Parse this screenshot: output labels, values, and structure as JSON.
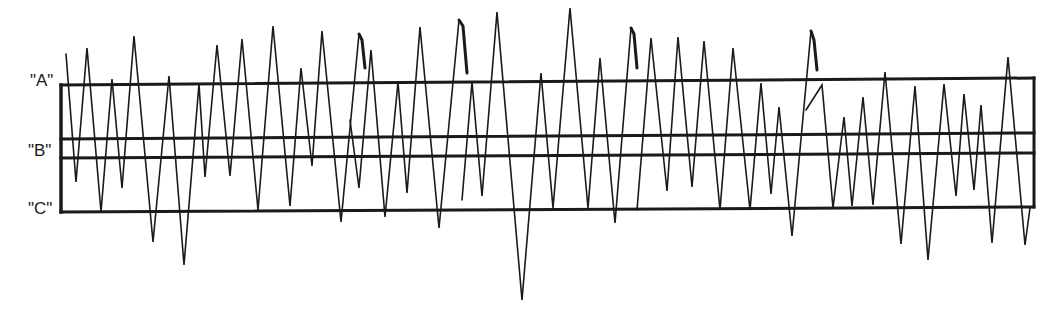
{
  "diagram": {
    "labels": {
      "a": "\"A\"",
      "b": "\"B\"",
      "c": "\"C\"",
      "a_pos": [
        30,
        72
      ],
      "b_pos": [
        28,
        142
      ],
      "c_pos": [
        28,
        200
      ]
    },
    "colors": {
      "ink": "#1a1a1a",
      "background": "#ffffff"
    },
    "box": {
      "left_x": 61,
      "right_x": 1034,
      "lines": {
        "A": {
          "y_left": 85,
          "y_right": 78
        },
        "B_upper": {
          "y_left": 139,
          "y_right": 133
        },
        "B_lower": {
          "y_left": 158,
          "y_right": 153
        },
        "C": {
          "y_left": 212,
          "y_right": 207
        }
      }
    },
    "waveform": {
      "main_trace": [
        [
          66,
          54
        ],
        [
          76,
          182
        ],
        [
          87,
          48
        ],
        [
          101,
          212
        ],
        [
          112,
          79
        ],
        [
          122,
          188
        ],
        [
          134,
          36
        ],
        [
          153,
          242
        ],
        [
          169,
          76
        ],
        [
          184,
          265
        ],
        [
          199,
          84
        ],
        [
          205,
          177
        ],
        [
          217,
          45
        ],
        [
          230,
          176
        ],
        [
          242,
          39
        ],
        [
          258,
          210
        ],
        [
          273,
          26
        ],
        [
          290,
          206
        ],
        [
          301,
          68
        ],
        [
          312,
          166
        ],
        [
          322,
          31
        ],
        [
          341,
          222
        ],
        [
          359,
          34
        ]
      ],
      "hooks": [
        [
          [
            359,
            34
          ],
          [
            362,
            40
          ],
          [
            365,
            68
          ]
        ],
        [
          [
            459,
            20
          ],
          [
            463,
            26
          ],
          [
            467,
            73
          ]
        ],
        [
          [
            631,
            28
          ],
          [
            634,
            34
          ],
          [
            637,
            68
          ]
        ],
        [
          [
            811,
            31
          ],
          [
            814,
            40
          ],
          [
            817,
            70
          ]
        ]
      ],
      "traces": [
        [
          [
            350,
            120
          ],
          [
            359,
            188
          ],
          [
            371,
            50
          ],
          [
            385,
            217
          ],
          [
            398,
            82
          ],
          [
            407,
            193
          ],
          [
            420,
            27
          ],
          [
            439,
            228
          ],
          [
            459,
            20
          ]
        ],
        [
          [
            462,
            200
          ],
          [
            472,
            82
          ],
          [
            482,
            196
          ],
          [
            497,
            12
          ],
          [
            522,
            300
          ],
          [
            541,
            73
          ],
          [
            553,
            208
          ],
          [
            570,
            8
          ],
          [
            588,
            208
          ],
          [
            600,
            58
          ],
          [
            615,
            223
          ],
          [
            631,
            28
          ]
        ],
        [
          [
            637,
            210
          ],
          [
            651,
            38
          ],
          [
            667,
            191
          ],
          [
            678,
            37
          ],
          [
            692,
            187
          ],
          [
            704,
            41
          ],
          [
            720,
            210
          ],
          [
            733,
            48
          ],
          [
            750,
            210
          ],
          [
            761,
            83
          ],
          [
            771,
            194
          ],
          [
            779,
            107
          ],
          [
            792,
            236
          ],
          [
            811,
            31
          ]
        ],
        [
          [
            806,
            110
          ],
          [
            822,
            85
          ],
          [
            833,
            208
          ],
          [
            844,
            117
          ],
          [
            852,
            206
          ],
          [
            863,
            97
          ],
          [
            873,
            205
          ],
          [
            885,
            72
          ],
          [
            901,
            244
          ],
          [
            915,
            86
          ],
          [
            928,
            260
          ],
          [
            944,
            84
          ],
          [
            956,
            196
          ],
          [
            964,
            94
          ],
          [
            974,
            190
          ],
          [
            981,
            105
          ],
          [
            992,
            243
          ],
          [
            1008,
            57
          ],
          [
            1025,
            245
          ],
          [
            1030,
            208
          ]
        ]
      ]
    }
  }
}
